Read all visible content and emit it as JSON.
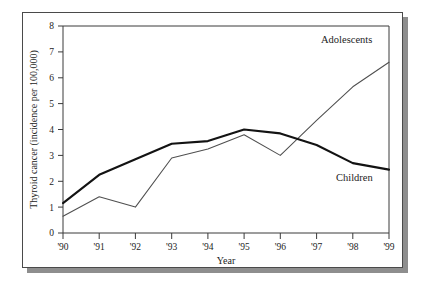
{
  "chart_data": {
    "type": "line",
    "title": "",
    "subtitle": "",
    "xlabel": "Year",
    "ylabel": "Thyroid cancer (incidence per 100,000)",
    "x": [
      "'90",
      "'91",
      "'92",
      "'93",
      "'94",
      "'95",
      "'96",
      "'97",
      "'98",
      "'99"
    ],
    "categories": [
      "'90",
      "'91",
      "'92",
      "'93",
      "'94",
      "'95",
      "'96",
      "'97",
      "'98",
      "'99"
    ],
    "xtick_labels": [
      "'90",
      "'91",
      "'92",
      "'93",
      "'94",
      "'95",
      "'96",
      "'97",
      "'98",
      "'99"
    ],
    "ytick_labels": [
      "0",
      "1",
      "2",
      "3",
      "4",
      "5",
      "6",
      "7",
      "8"
    ],
    "ytick_values": [
      0,
      1,
      2,
      3,
      4,
      5,
      6,
      7,
      8
    ],
    "ylim": [
      0,
      8
    ],
    "xlim": [
      "'90",
      "'99"
    ],
    "grid": false,
    "legend_position": "inline-annotation",
    "series": [
      {
        "name": "Children",
        "label": "Children",
        "style": "thick-solid",
        "color": "#131313",
        "values": [
          1.15,
          2.25,
          2.85,
          3.45,
          3.55,
          4.0,
          3.85,
          3.4,
          2.7,
          2.45
        ]
      },
      {
        "name": "Adolescents",
        "label": "Adolescents",
        "style": "thin-solid",
        "color": "#4f4f4f",
        "values": [
          0.65,
          1.4,
          1.0,
          2.9,
          3.25,
          3.8,
          3.0,
          4.35,
          5.65,
          6.6
        ]
      }
    ],
    "annotations": [
      {
        "text": "Adolescents",
        "series": "Adolescents",
        "x": "'97",
        "y": 7.25
      },
      {
        "text": "Children",
        "series": "Children",
        "x": "'98",
        "y": 2.15
      }
    ]
  },
  "axes": {
    "x_title": "Year",
    "y_title": "Thyroid cancer (incidence per 100,000)"
  },
  "labels": {
    "adolescents": "Adolescents",
    "children": "Children"
  },
  "colors": {
    "children_line": "#131313",
    "adolescents_line": "#4f4f4f",
    "axis": "#3a3a3a",
    "card_border": "#4a4a4a",
    "card_shadow": "#8e8e8e",
    "text": "#1c1c1c",
    "background": "#ffffff"
  }
}
